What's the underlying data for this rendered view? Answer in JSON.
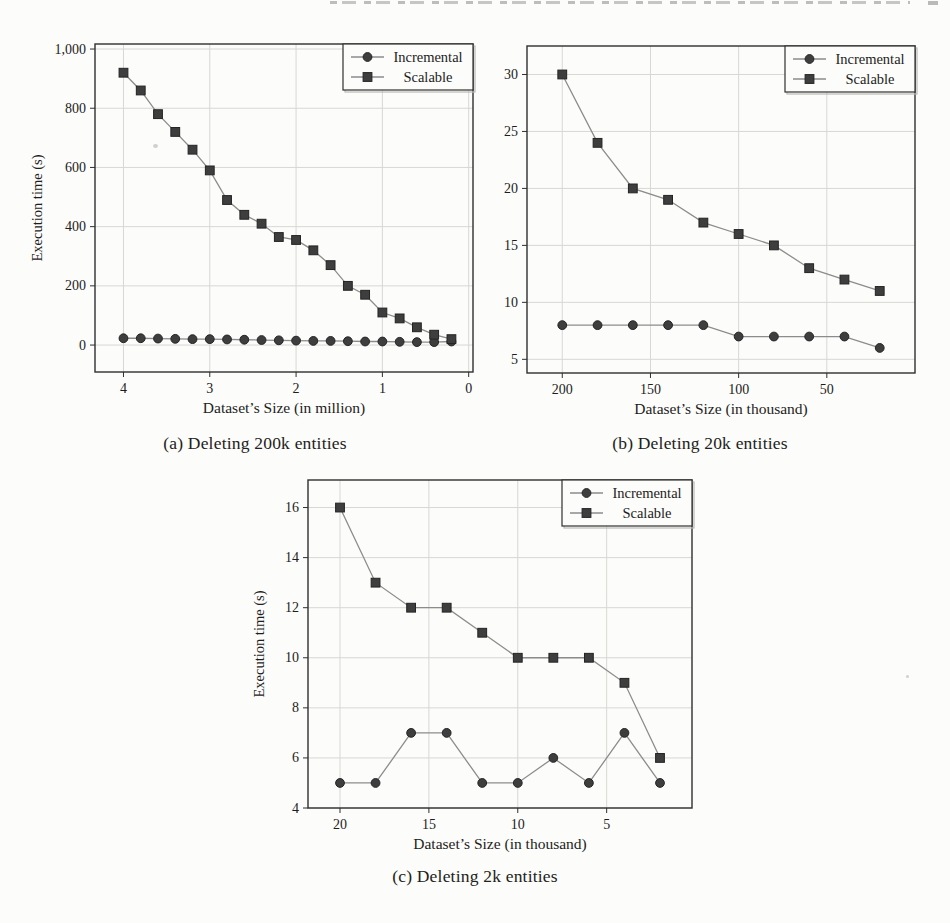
{
  "figure": {
    "captions": {
      "a": "(a) Deleting 200k entities",
      "b": "(b) Deleting 20k entities",
      "c": "(c) Deleting 2k entities"
    }
  },
  "colors": {
    "paper": "#fcfcfa",
    "frame": "#2f2f2f",
    "grid": "#d7d7d4",
    "line": "#8c8c8c",
    "marker_fill": "#3e3e3e",
    "marker_edge": "#242424",
    "text": "#1d1d1d"
  },
  "chart_data": [
    {
      "id": "a",
      "type": "line",
      "title": "(a) Deleting 200k entities",
      "xlabel": "Dataset’s Size (in million)",
      "ylabel": "Execution time (s)",
      "x_axis_reversed": true,
      "grid": true,
      "legend_position": "top-right",
      "xlim": [
        4.33,
        -0.05
      ],
      "ylim": [
        -91,
        1017
      ],
      "xticks": {
        "values": [
          4,
          3,
          2,
          1,
          0
        ],
        "labels": [
          "4",
          "3",
          "2",
          "1",
          "0"
        ]
      },
      "yticks": {
        "values": [
          0,
          200,
          400,
          600,
          800,
          1000
        ],
        "labels": [
          "0",
          "200",
          "400",
          "600",
          "800",
          "1,000"
        ]
      },
      "x": [
        4.0,
        3.8,
        3.6,
        3.4,
        3.2,
        3.0,
        2.8,
        2.6,
        2.4,
        2.2,
        2.0,
        1.8,
        1.6,
        1.4,
        1.2,
        1.0,
        0.8,
        0.6,
        0.4,
        0.2
      ],
      "series": [
        {
          "name": "Incremental",
          "marker": "circle",
          "values": [
            23,
            23,
            22,
            21,
            20,
            20,
            19,
            18,
            17,
            16,
            15,
            14,
            14,
            13,
            12,
            12,
            11,
            10,
            10,
            12
          ]
        },
        {
          "name": "Scalable",
          "marker": "square",
          "values": [
            920,
            860,
            780,
            720,
            660,
            590,
            490,
            440,
            410,
            365,
            355,
            320,
            270,
            200,
            170,
            110,
            90,
            60,
            35,
            20
          ]
        }
      ]
    },
    {
      "id": "b",
      "type": "line",
      "title": "(b) Deleting 20k entities",
      "xlabel": "Dataset’s Size (in thousand)",
      "ylabel": "",
      "x_axis_reversed": true,
      "grid": true,
      "legend_position": "top-right",
      "xlim": [
        220,
        0
      ],
      "ylim": [
        3.8,
        32.5
      ],
      "xticks": {
        "values": [
          200,
          150,
          100,
          50
        ],
        "labels": [
          "200",
          "150",
          "100",
          "50"
        ]
      },
      "yticks": {
        "values": [
          5,
          10,
          15,
          20,
          25,
          30
        ],
        "labels": [
          "5",
          "10",
          "15",
          "20",
          "25",
          "30"
        ]
      },
      "x": [
        200,
        180,
        160,
        140,
        120,
        100,
        80,
        60,
        40,
        20
      ],
      "series": [
        {
          "name": "Incremental",
          "marker": "circle",
          "values": [
            8,
            8,
            8,
            8,
            8,
            7,
            7,
            7,
            7,
            6
          ]
        },
        {
          "name": "Scalable",
          "marker": "square",
          "values": [
            30,
            24,
            20,
            19,
            17,
            16,
            15,
            13,
            12,
            11
          ]
        }
      ]
    },
    {
      "id": "c",
      "type": "line",
      "title": "(c) Deleting 2k entities",
      "xlabel": "Dataset’s Size (in thousand)",
      "ylabel": "Execution time (s)",
      "x_axis_reversed": true,
      "grid": true,
      "legend_position": "top-right",
      "xlim": [
        21.8,
        0.2
      ],
      "ylim": [
        4,
        17.1
      ],
      "xticks": {
        "values": [
          20,
          15,
          10,
          5
        ],
        "labels": [
          "20",
          "15",
          "10",
          "5"
        ]
      },
      "yticks": {
        "values": [
          4,
          6,
          8,
          10,
          12,
          14,
          16
        ],
        "labels": [
          "4",
          "6",
          "8",
          "10",
          "12",
          "14",
          "16"
        ]
      },
      "x": [
        20,
        18,
        16,
        14,
        12,
        10,
        8,
        6,
        4,
        2
      ],
      "series": [
        {
          "name": "Incremental",
          "marker": "circle",
          "values": [
            5,
            5,
            7,
            7,
            5,
            5,
            6,
            5,
            7,
            5
          ]
        },
        {
          "name": "Scalable",
          "marker": "square",
          "values": [
            16,
            13,
            12,
            12,
            11,
            10,
            10,
            10,
            9,
            6
          ]
        }
      ]
    }
  ],
  "legend": {
    "items": [
      {
        "label": "Incremental",
        "marker": "circle-icon"
      },
      {
        "label": "Scalable",
        "marker": "square-icon"
      }
    ]
  }
}
